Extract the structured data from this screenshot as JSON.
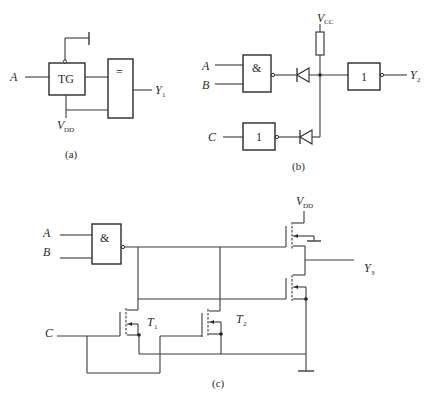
{
  "figure": {
    "panels": [
      {
        "id": "a",
        "caption": "(a)",
        "inputs": [
          "A"
        ],
        "output": {
          "name": "Y",
          "sub": "1"
        },
        "supply": {
          "name": "V",
          "sub": "DD"
        },
        "components": [
          {
            "type": "transmission-gate",
            "label": "TG"
          },
          {
            "type": "xnor-gate",
            "label": "="
          }
        ]
      },
      {
        "id": "b",
        "caption": "(b)",
        "inputs": [
          "A",
          "B",
          "C"
        ],
        "output": {
          "name": "Y",
          "sub": "2"
        },
        "supply": {
          "name": "V",
          "sub": "CC"
        },
        "components": [
          {
            "type": "nand-gate",
            "label": "&"
          },
          {
            "type": "inverter",
            "label": "1"
          },
          {
            "type": "inverter",
            "label": "1"
          },
          {
            "type": "diode"
          },
          {
            "type": "diode"
          },
          {
            "type": "resistor"
          }
        ]
      },
      {
        "id": "c",
        "caption": "(c)",
        "inputs": [
          "A",
          "B",
          "C"
        ],
        "output": {
          "name": "Y",
          "sub": "3"
        },
        "supply": {
          "name": "V",
          "sub": "DD"
        },
        "transistors": [
          {
            "name": "T",
            "sub": "1"
          },
          {
            "name": "T",
            "sub": "2"
          }
        ],
        "components": [
          {
            "type": "nand-gate",
            "label": "&"
          }
        ]
      }
    ]
  }
}
